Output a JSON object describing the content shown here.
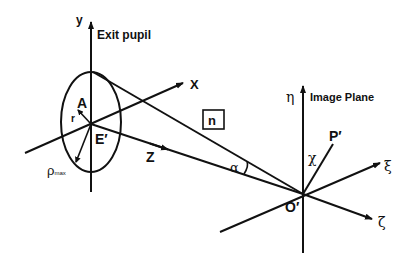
{
  "diagram": {
    "labels": {
      "y_axis": "y",
      "exit_pupil": "Exit pupil",
      "x_axis": "X",
      "point_a": "A",
      "radius": "r",
      "center_e": "E′",
      "rho_max_main": "ρ",
      "rho_max_sub": "max",
      "z_axis": "Z",
      "normal_box": "n",
      "angle_alpha": "α",
      "eta_axis": "η",
      "image_plane": "Image Plane",
      "point_p": "P′",
      "angle_chi": "χ",
      "xi_axis": "ξ",
      "origin_o": "O′",
      "zeta_axis": "ζ"
    },
    "colors": {
      "stroke": "#111111",
      "background": "#ffffff"
    }
  }
}
